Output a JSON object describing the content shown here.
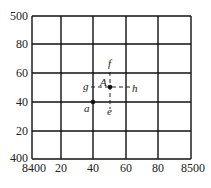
{
  "diagram": {
    "type": "grid-interpolation",
    "grid": {
      "columns": 5,
      "rows": 5,
      "line_color": "#111111"
    },
    "x_axis": {
      "ticks": [
        "8400",
        "20",
        "40",
        "60",
        "80",
        "8500"
      ]
    },
    "y_axis": {
      "ticks": [
        "400",
        "20",
        "40",
        "60",
        "80",
        "500"
      ]
    },
    "points": {
      "A": {
        "label": "A",
        "x": 50,
        "y": 50
      },
      "a": {
        "label": "a",
        "x": 40,
        "y": 40
      }
    },
    "dashed_labels": {
      "f": "f",
      "e": "e",
      "g": "g",
      "h": "h"
    }
  }
}
